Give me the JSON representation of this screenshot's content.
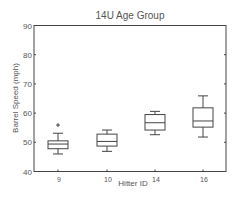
{
  "chart_data": {
    "type": "box",
    "title": "14U Age Group",
    "xlabel": "Hitter ID",
    "ylabel": "Barrel Speed (mph)",
    "ylim": [
      40,
      90
    ],
    "yticks": [
      40,
      50,
      60,
      70,
      80,
      90
    ],
    "grid": false,
    "legend": null,
    "categories": [
      "9",
      "10",
      "14",
      "16"
    ],
    "boxes": [
      {
        "id": "9",
        "whisker_low": 46.0,
        "q1": 47.8,
        "median": 49.4,
        "q3": 50.5,
        "whisker_high": 53.1,
        "outliers": [
          55.9
        ]
      },
      {
        "id": "10",
        "whisker_low": 46.9,
        "q1": 48.7,
        "median": 50.3,
        "q3": 52.8,
        "whisker_high": 54.2,
        "outliers": []
      },
      {
        "id": "14",
        "whisker_low": 52.6,
        "q1": 54.2,
        "median": 56.7,
        "q3": 59.5,
        "whisker_high": 60.6,
        "outliers": []
      },
      {
        "id": "16",
        "whisker_low": 51.8,
        "q1": 55.2,
        "median": 57.3,
        "q3": 61.8,
        "whisker_high": 65.9,
        "outliers": []
      }
    ]
  },
  "colors": {
    "axis": "#444444",
    "box": "#444444",
    "text": "#555555"
  }
}
